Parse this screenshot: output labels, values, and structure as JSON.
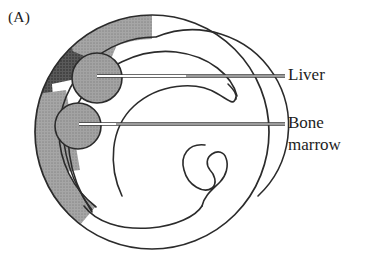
{
  "figure": {
    "panel_label": "(A)"
  },
  "callouts": [
    {
      "id": "liver",
      "label": "Liver",
      "icon": "leader-line-icon"
    },
    {
      "id": "bone-marrow",
      "label": "Bone\nmarrow",
      "icon": "leader-line-icon"
    }
  ],
  "colors": {
    "outline": "#2b2b2b",
    "shade_light": "#9c9c9c",
    "shade_dark": "#4c4c4c",
    "organ_fill": "#9a9a9a",
    "organ_stroke": "#2b2b2b",
    "gap_white": "#ffffff",
    "leader_line": "#ffffff",
    "leader_edge": "#3a3a3a",
    "text": "#1d1d1d",
    "background": "#ffffff"
  },
  "geometry": {
    "outer_circle": {
      "cx": 152,
      "cy": 132,
      "r": 118
    },
    "organs": [
      {
        "name": "liver",
        "cx": 97,
        "cy": 78,
        "r": 25
      },
      {
        "name": "bone-marrow",
        "cx": 78,
        "cy": 126,
        "r": 23
      }
    ],
    "leader_lines": [
      {
        "name": "liver",
        "x1": 97,
        "y1": 76,
        "x2": 285,
        "y2": 76
      },
      {
        "name": "bone-marrow",
        "x1": 79,
        "y1": 124,
        "x2": 285,
        "y2": 124
      }
    ]
  }
}
